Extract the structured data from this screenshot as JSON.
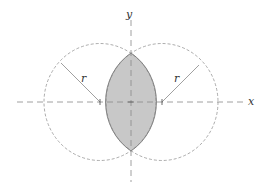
{
  "diagram": {
    "axes": {
      "x_label": "x",
      "y_label": "y"
    },
    "radius_labels": {
      "left": "r",
      "right": "r"
    },
    "colors": {
      "lens_fill": "#c8c8c8",
      "lens_stroke": "#666666",
      "dashed": "#888888",
      "radius_line": "#888888"
    }
  }
}
